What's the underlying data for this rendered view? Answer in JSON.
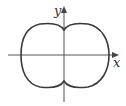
{
  "diagram": {
    "type": "polar-curve-plot",
    "axes": {
      "x_label": "x",
      "y_label": "y"
    },
    "colors": {
      "curve": "#3a3a3a",
      "axes": "#555555",
      "background": "#ffffff"
    },
    "curve_description": "closed peanut-shaped curve symmetric about both axes, with inward dimples on the y-axis"
  }
}
